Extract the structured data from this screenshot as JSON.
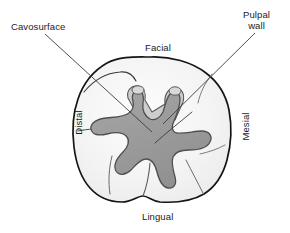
{
  "figure": {
    "callouts": [
      {
        "id": "cavosurface",
        "label": "Cavosurface",
        "lines": [
          "Cavosurface"
        ]
      },
      {
        "id": "pulpal-wall",
        "label": "Pulpal wall",
        "lines": [
          "Pulpal",
          "wall"
        ]
      }
    ],
    "orientation_labels": [
      {
        "id": "facial",
        "label": "Facial",
        "position": "top"
      },
      {
        "id": "lingual",
        "label": "Lingual",
        "position": "bottom"
      },
      {
        "id": "distal",
        "label": "Distal",
        "position": "left",
        "rotation": -90
      },
      {
        "id": "mesial",
        "label": "Mesial",
        "position": "right",
        "rotation": -90
      }
    ],
    "colors": {
      "background": "#ffffff",
      "tooth_fill": "#f3f3f3",
      "tooth_outline": "#151515",
      "cavity_fill": "#9a9a9a",
      "cavity_rim": "#cfcfcf",
      "cavity_outline": "#4a4a4a",
      "groove_line": "#6e6e6e",
      "leader_line": "#3c3c3c",
      "text": "#1b1b1b"
    }
  }
}
